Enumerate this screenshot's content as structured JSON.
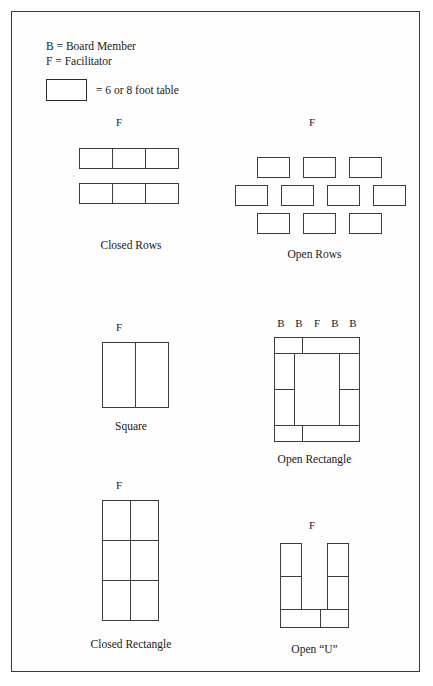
{
  "figure": {
    "artifact_text": "",
    "legend": {
      "line_b": "B = Board Member",
      "line_f": "F = Facilitator",
      "swatch_label": "= 6 or 8 foot table",
      "swatch_name": "table-swatch"
    },
    "arrangements": [
      {
        "id": "closed-rows",
        "caption": "Closed Rows",
        "markers": [
          "F"
        ],
        "tables": 6,
        "description": "Two joined horizontal rows of three tables each, facilitator centered above"
      },
      {
        "id": "open-rows",
        "caption": "Open Rows",
        "markers": [
          "F"
        ],
        "tables": 10,
        "description": "Three staggered rows of separated tables: 3 top, 4 middle, 3 bottom"
      },
      {
        "id": "square",
        "caption": "Square",
        "markers": [
          "F"
        ],
        "tables": 2,
        "description": "One square formed by two tables side by side"
      },
      {
        "id": "open-rectangle",
        "caption": "Open Rectangle",
        "markers": [
          "B",
          "B",
          "F",
          "B",
          "B"
        ],
        "tables": 8,
        "description": "Hollow rectangle of tables with seating on the outside"
      },
      {
        "id": "closed-rectangle",
        "caption": "Closed Rectangle",
        "markers": [
          "F"
        ],
        "tables": 6,
        "description": "Solid rectangle two tables wide by three tables deep"
      },
      {
        "id": "open-u",
        "caption": "Open “U”",
        "markers": [
          "F"
        ],
        "tables": 6,
        "description": "U shape made of two vertical arms of two tables and a bottom bar of two tables"
      }
    ]
  },
  "style": {
    "line_color": "#3c3c3c",
    "text_color": "#1a1a1a",
    "page_background": "#ffffff"
  }
}
